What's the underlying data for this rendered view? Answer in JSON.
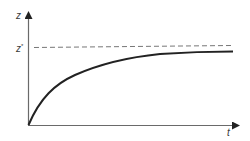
{
  "diagram": {
    "title": "",
    "y_axis": {
      "label": "z"
    },
    "x_axis": {
      "label": "t"
    },
    "asymptote": {
      "label": "z",
      "label_superscript": "*",
      "style": "dashed"
    },
    "curve": {
      "shape": "saturating-exponential",
      "description": "rises from origin and levels off just below z*"
    }
  },
  "colors": {
    "axis": "#555555",
    "curve": "#222222",
    "dashed": "#777777",
    "text": "#3a3a3a",
    "background": "#ffffff"
  }
}
